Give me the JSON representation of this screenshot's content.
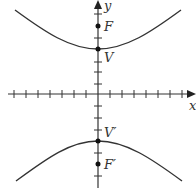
{
  "diagram": {
    "type": "hyperbola-vertical-transverse-axis",
    "axes": {
      "x_label": "x",
      "y_label": "y",
      "tick_spacing_px": 12
    },
    "points": {
      "F": "F",
      "V": "V",
      "V_prime": "V′",
      "F_prime": "F′"
    },
    "colors": {
      "stroke": "#333333",
      "background": "#ffffff"
    }
  }
}
